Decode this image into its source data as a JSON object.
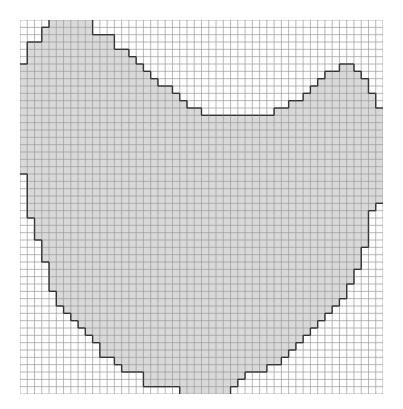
{
  "figure": {
    "grid": {
      "cols": 50,
      "rows": 51,
      "line_color": "#9a9a9a",
      "background": "#ffffff"
    },
    "shape": {
      "fill_color": "#d9d9d9",
      "outline_color": "#333333",
      "row_spans": [
        [
          [
            4,
            10
          ]
        ],
        [
          [
            3,
            10
          ]
        ],
        [
          [
            3,
            13
          ]
        ],
        [
          [
            1,
            13
          ]
        ],
        [
          [
            1,
            15
          ]
        ],
        [
          [
            1,
            16
          ]
        ],
        [
          [
            0,
            17
          ],
          [
            44,
            46
          ]
        ],
        [
          [
            0,
            18
          ],
          [
            42,
            47
          ]
        ],
        [
          [
            0,
            19
          ],
          [
            41,
            48
          ]
        ],
        [
          [
            0,
            21
          ],
          [
            40,
            48
          ]
        ],
        [
          [
            0,
            22
          ],
          [
            39,
            49
          ]
        ],
        [
          [
            0,
            23
          ],
          [
            37,
            49
          ]
        ],
        [
          [
            0,
            25
          ],
          [
            35,
            50
          ]
        ],
        [
          [
            0,
            50
          ]
        ],
        [
          [
            0,
            50
          ]
        ],
        [
          [
            0,
            50
          ]
        ],
        [
          [
            0,
            50
          ]
        ],
        [
          [
            0,
            50
          ]
        ],
        [
          [
            0,
            50
          ]
        ],
        [
          [
            0,
            50
          ]
        ],
        [
          [
            0,
            50
          ]
        ],
        [
          [
            1,
            50
          ]
        ],
        [
          [
            1,
            50
          ]
        ],
        [
          [
            1,
            50
          ]
        ],
        [
          [
            1,
            50
          ]
        ],
        [
          [
            1,
            49
          ]
        ],
        [
          [
            1,
            48
          ]
        ],
        [
          [
            2,
            48
          ]
        ],
        [
          [
            2,
            48
          ]
        ],
        [
          [
            2,
            48
          ]
        ],
        [
          [
            3,
            48
          ]
        ],
        [
          [
            3,
            47
          ]
        ],
        [
          [
            3,
            47
          ]
        ],
        [
          [
            4,
            47
          ]
        ],
        [
          [
            4,
            46
          ]
        ],
        [
          [
            4,
            46
          ]
        ],
        [
          [
            4,
            45
          ]
        ],
        [
          [
            5,
            45
          ]
        ],
        [
          [
            5,
            44
          ]
        ],
        [
          [
            6,
            43
          ]
        ],
        [
          [
            7,
            42
          ]
        ],
        [
          [
            8,
            41
          ]
        ],
        [
          [
            9,
            40
          ]
        ],
        [
          [
            10,
            39
          ]
        ],
        [
          [
            11,
            38
          ]
        ],
        [
          [
            11,
            37
          ]
        ],
        [
          [
            13,
            36
          ]
        ],
        [
          [
            14,
            34
          ]
        ],
        [
          [
            17,
            31
          ]
        ],
        [
          [
            17,
            30
          ]
        ],
        [
          [
            22,
            29
          ]
        ]
      ]
    }
  }
}
